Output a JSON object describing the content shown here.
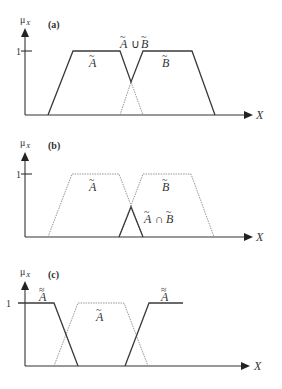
{
  "figure": {
    "panels": [
      {
        "id": "a",
        "panel_label": "(a)",
        "y_axis_label": "μ",
        "y_axis_subscript": "X",
        "x_axis_label": "X",
        "tick_label": "1",
        "set_a_label": "A",
        "set_b_label": "B",
        "operation_label_a": "A",
        "operation_symbol": "∪",
        "operation_label_b": "B",
        "description": "Union of fuzzy sets A and B (solid outline = max)"
      },
      {
        "id": "b",
        "panel_label": "(b)",
        "y_axis_label": "μ",
        "y_axis_subscript": "X",
        "x_axis_label": "X",
        "tick_label": "1",
        "set_a_label": "A",
        "set_b_label": "B",
        "operation_label_a": "A",
        "operation_symbol": "∩",
        "operation_label_b": "B",
        "description": "Intersection of fuzzy sets A and B (solid triangle = min)"
      },
      {
        "id": "c",
        "panel_label": "(c)",
        "y_axis_label": "μ",
        "y_axis_subscript": "X",
        "x_axis_label": "X",
        "tick_label": "1",
        "set_a_label": "A",
        "complement_left_label": "A",
        "complement_right_label": "A",
        "tilde": "~",
        "double_tilde": "≈",
        "description": "Complement of fuzzy set A (solid = complement)"
      }
    ]
  }
}
